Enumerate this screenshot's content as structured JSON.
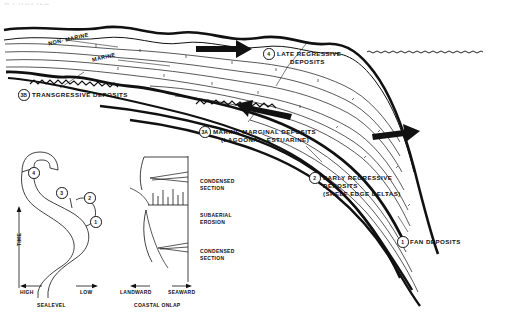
{
  "figure": {
    "top_cut_text": "A PROFILE",
    "domain_note": "sequence-stratigraphy-cross-section"
  },
  "cross_section": {
    "facies_labels": [
      {
        "name": "non-marine-label",
        "text": "NON- MARINE"
      },
      {
        "name": "marine-label",
        "text": "MARINE"
      }
    ],
    "callouts": [
      {
        "id": "3B",
        "line1": "TRANSGRESSIVE DEPOSITS",
        "line2": "",
        "line3": ""
      },
      {
        "id": "4",
        "line1": "LATE REGRESSIVE",
        "line2": "DEPOSITS",
        "line3": ""
      },
      {
        "id": "3A",
        "line1": "MARINE MARGINAL DEPOSITS",
        "line2": "(LAGOONAL, ESTUARINE)",
        "line3": ""
      },
      {
        "id": "2",
        "line1": "EARLY REGRESSIVE",
        "line2": "DEPOSITS",
        "line3": "(SHELF EDGE DELTAS)"
      },
      {
        "id": "1",
        "line1": "FAN DEPOSITS",
        "line2": "",
        "line3": ""
      }
    ],
    "arrows": [
      {
        "name": "arrow-late-regressive",
        "direction": "right"
      },
      {
        "name": "arrow-transgressive",
        "direction": "left"
      },
      {
        "name": "arrow-early-regressive",
        "direction": "right"
      }
    ],
    "sea_surface": {
      "name": "sea-level-water-line",
      "style": "wavy-dashed"
    }
  },
  "sealevel_chart": {
    "title": "SEALEVEL",
    "y_axis_label": "TIME",
    "axis_left_label": "HIGH",
    "axis_right_label": "LOW",
    "stage_markers": [
      "4",
      "3",
      "2",
      "1"
    ]
  },
  "onlap_chart": {
    "title": "COASTAL ONLAP",
    "axis_left_label": "LANDWARD",
    "axis_right_label": "SEAWARD",
    "annotations": [
      {
        "name": "condensed-section-upper",
        "line1": "CONDENSED",
        "line2": "SECTION"
      },
      {
        "name": "subaerial-erosion",
        "line1": "SUBAERIAL",
        "line2": "EROSION"
      },
      {
        "name": "condensed-section-lower",
        "line1": "CONDENSED",
        "line2": "SECTION"
      }
    ]
  },
  "colors": {
    "ink": "#111111",
    "paper": "#ffffff",
    "faint": "#9a9aa2"
  }
}
